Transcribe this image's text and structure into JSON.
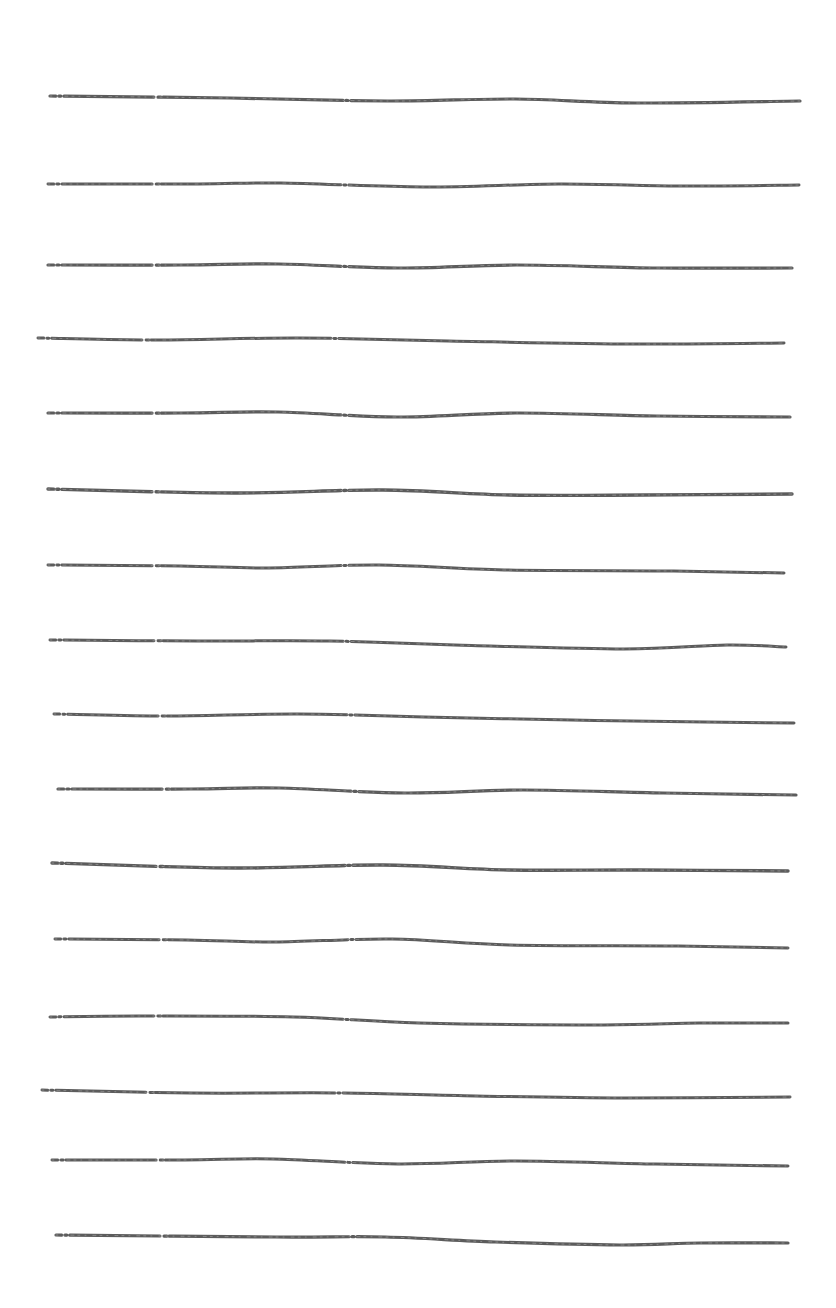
{
  "page": {
    "width": 836,
    "height": 1308,
    "background": "#ffffff",
    "ink_color": "#4a4a4a"
  },
  "lines": [
    {
      "x1": 50,
      "y_start": 98,
      "x2": 800,
      "y_end": 104,
      "wave": [
        [
          0.0,
          -2
        ],
        [
          0.24,
          0
        ],
        [
          0.45,
          3
        ],
        [
          0.62,
          1
        ],
        [
          0.78,
          5
        ],
        [
          1.0,
          3
        ]
      ],
      "width": 3.2
    },
    {
      "x1": 48,
      "y_start": 184,
      "x2": 799,
      "y_end": 189,
      "wave": [
        [
          0.0,
          0
        ],
        [
          0.2,
          0
        ],
        [
          0.31,
          -1
        ],
        [
          0.5,
          3
        ],
        [
          0.68,
          0
        ],
        [
          0.84,
          2
        ],
        [
          1.0,
          1
        ]
      ],
      "width": 3.0
    },
    {
      "x1": 48,
      "y_start": 265,
      "x2": 792,
      "y_end": 271,
      "wave": [
        [
          0.0,
          0
        ],
        [
          0.18,
          0
        ],
        [
          0.31,
          -1
        ],
        [
          0.47,
          3
        ],
        [
          0.63,
          0
        ],
        [
          0.82,
          3
        ],
        [
          1.0,
          3
        ]
      ],
      "width": 3.2
    },
    {
      "x1": 38,
      "y_start": 338,
      "x2": 784,
      "y_end": 347,
      "wave": [
        [
          0.0,
          0
        ],
        [
          0.16,
          2
        ],
        [
          0.35,
          0
        ],
        [
          0.55,
          3
        ],
        [
          0.8,
          6
        ],
        [
          1.0,
          5
        ]
      ],
      "width": 3.0
    },
    {
      "x1": 48,
      "y_start": 413,
      "x2": 790,
      "y_end": 420,
      "wave": [
        [
          0.0,
          0
        ],
        [
          0.18,
          0
        ],
        [
          0.31,
          -1
        ],
        [
          0.47,
          4
        ],
        [
          0.63,
          0
        ],
        [
          0.82,
          3
        ],
        [
          1.0,
          4
        ]
      ],
      "width": 3.2
    },
    {
      "x1": 48,
      "y_start": 489,
      "x2": 792,
      "y_end": 495,
      "wave": [
        [
          0.0,
          0
        ],
        [
          0.25,
          4
        ],
        [
          0.45,
          1
        ],
        [
          0.62,
          6
        ],
        [
          0.8,
          6
        ],
        [
          1.0,
          5
        ]
      ],
      "width": 3.4
    },
    {
      "x1": 48,
      "y_start": 565,
      "x2": 784,
      "y_end": 573,
      "wave": [
        [
          0.0,
          0
        ],
        [
          0.18,
          1
        ],
        [
          0.3,
          3
        ],
        [
          0.45,
          0
        ],
        [
          0.62,
          5
        ],
        [
          0.85,
          6
        ],
        [
          1.0,
          8
        ]
      ],
      "width": 3.0
    },
    {
      "x1": 50,
      "y_start": 640,
      "x2": 786,
      "y_end": 647,
      "wave": [
        [
          0.0,
          0
        ],
        [
          0.2,
          1
        ],
        [
          0.38,
          1
        ],
        [
          0.55,
          5
        ],
        [
          0.78,
          9
        ],
        [
          0.92,
          5
        ],
        [
          1.0,
          7
        ]
      ],
      "width": 3.0
    },
    {
      "x1": 54,
      "y_start": 714,
      "x2": 794,
      "y_end": 723,
      "wave": [
        [
          0.0,
          0
        ],
        [
          0.15,
          2
        ],
        [
          0.33,
          0
        ],
        [
          0.5,
          3
        ],
        [
          0.7,
          6
        ],
        [
          0.88,
          8
        ],
        [
          1.0,
          9
        ]
      ],
      "width": 3.0
    },
    {
      "x1": 58,
      "y_start": 789,
      "x2": 796,
      "y_end": 796,
      "wave": [
        [
          0.0,
          0
        ],
        [
          0.18,
          0
        ],
        [
          0.3,
          -1
        ],
        [
          0.47,
          4
        ],
        [
          0.63,
          1
        ],
        [
          0.82,
          4
        ],
        [
          1.0,
          6
        ]
      ],
      "width": 3.2
    },
    {
      "x1": 52,
      "y_start": 863,
      "x2": 788,
      "y_end": 871,
      "wave": [
        [
          0.0,
          0
        ],
        [
          0.25,
          5
        ],
        [
          0.45,
          2
        ],
        [
          0.62,
          7
        ],
        [
          0.8,
          7
        ],
        [
          1.0,
          8
        ]
      ],
      "width": 3.4
    },
    {
      "x1": 55,
      "y_start": 939,
      "x2": 788,
      "y_end": 948,
      "wave": [
        [
          0.0,
          0
        ],
        [
          0.18,
          1
        ],
        [
          0.3,
          3
        ],
        [
          0.46,
          0
        ],
        [
          0.62,
          6
        ],
        [
          0.85,
          7
        ],
        [
          1.0,
          9
        ]
      ],
      "width": 3.0
    },
    {
      "x1": 50,
      "y_start": 1017,
      "x2": 788,
      "y_end": 1023,
      "wave": [
        [
          0.0,
          0
        ],
        [
          0.12,
          -1
        ],
        [
          0.33,
          0
        ],
        [
          0.5,
          6
        ],
        [
          0.75,
          8
        ],
        [
          0.88,
          6
        ],
        [
          1.0,
          6
        ]
      ],
      "width": 3.0
    },
    {
      "x1": 42,
      "y_start": 1090,
      "x2": 790,
      "y_end": 1097,
      "wave": [
        [
          0.0,
          0
        ],
        [
          0.2,
          3
        ],
        [
          0.4,
          3
        ],
        [
          0.58,
          6
        ],
        [
          0.78,
          8
        ],
        [
          1.0,
          7
        ]
      ],
      "width": 3.0
    },
    {
      "x1": 52,
      "y_start": 1160,
      "x2": 788,
      "y_end": 1166,
      "wave": [
        [
          0.0,
          0
        ],
        [
          0.18,
          0
        ],
        [
          0.3,
          -1
        ],
        [
          0.47,
          4
        ],
        [
          0.63,
          1
        ],
        [
          0.82,
          4
        ],
        [
          1.0,
          6
        ]
      ],
      "width": 3.0
    },
    {
      "x1": 56,
      "y_start": 1235,
      "x2": 788,
      "y_end": 1244,
      "wave": [
        [
          0.0,
          0
        ],
        [
          0.3,
          2
        ],
        [
          0.45,
          2
        ],
        [
          0.6,
          7
        ],
        [
          0.77,
          10
        ],
        [
          0.88,
          8
        ],
        [
          1.0,
          8
        ]
      ],
      "width": 3.2
    }
  ]
}
